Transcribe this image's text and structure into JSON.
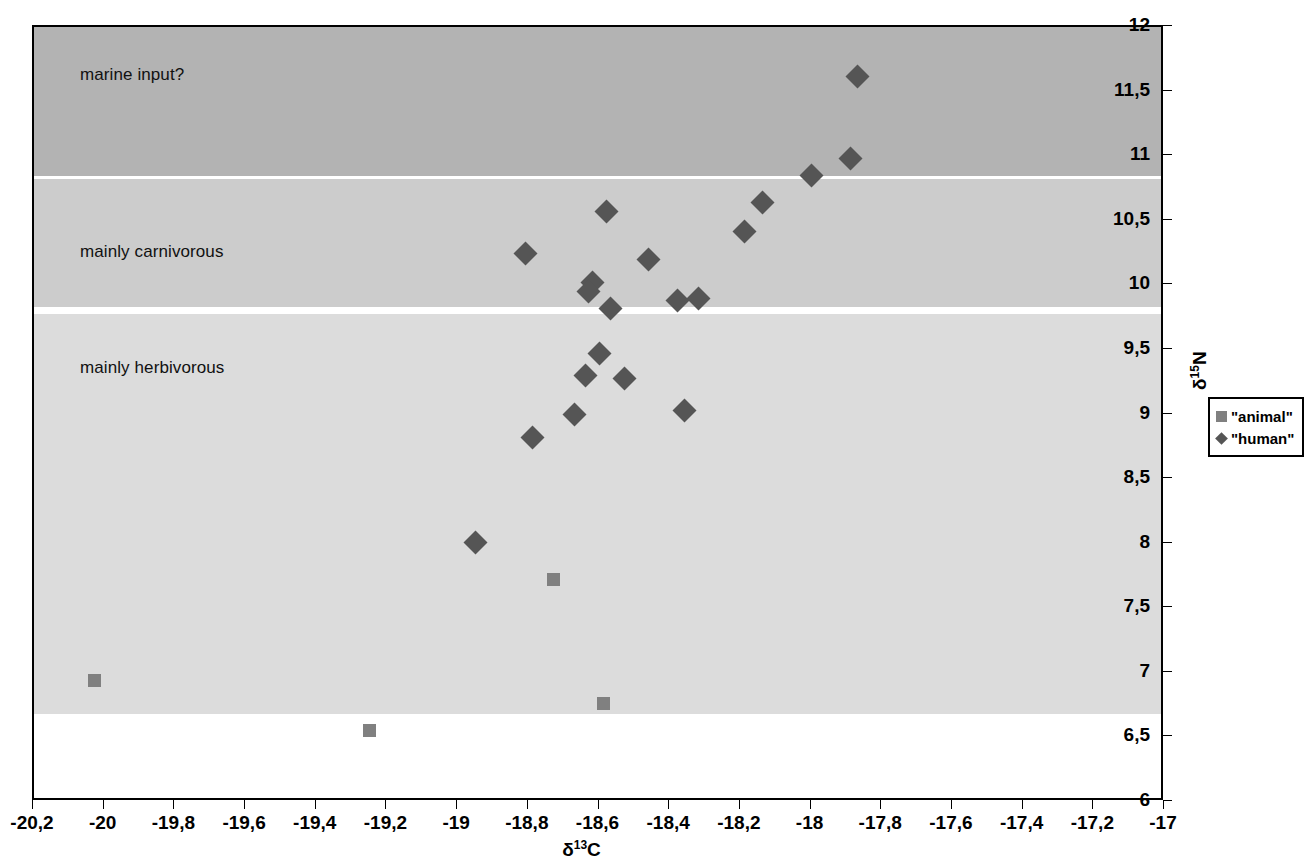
{
  "chart_data": {
    "type": "scatter",
    "title": "",
    "xlabel": "δ13C",
    "ylabel": "δ15N",
    "xlabel_base": "δ",
    "xlabel_sup": "13",
    "xlabel_tail": "C",
    "ylabel_base": "δ",
    "ylabel_sup": "15",
    "ylabel_tail": "N",
    "xlim": [
      -20.2,
      -17.0
    ],
    "ylim": [
      6,
      12
    ],
    "grid": false,
    "y_axis_position": "right",
    "xticks": [
      "-20,2",
      "-20",
      "-19,8",
      "-19,6",
      "-19,4",
      "-19,2",
      "-19",
      "-18,8",
      "-18,6",
      "-18,4",
      "-18,2",
      "-18",
      "-17,8",
      "-17,6",
      "-17,4",
      "-17,2",
      "-17"
    ],
    "xtick_values": [
      -20.2,
      -20.0,
      -19.8,
      -19.6,
      -19.4,
      -19.2,
      -19.0,
      -18.8,
      -18.6,
      -18.4,
      -18.2,
      -18.0,
      -17.8,
      -17.6,
      -17.4,
      -17.2,
      -17.0
    ],
    "yticks": [
      "12",
      "11,5",
      "11",
      "10,5",
      "10",
      "9,5",
      "9",
      "8,5",
      "8",
      "7,5",
      "7",
      "6,5",
      "6"
    ],
    "ytick_values": [
      12,
      11.5,
      11,
      10.5,
      10,
      9.5,
      9,
      8.5,
      8,
      7.5,
      7,
      6.5,
      6
    ],
    "legend_position": "outside-right",
    "legend": [
      {
        "label": "\"animal\"",
        "marker": "square",
        "color": "#808080"
      },
      {
        "label": "\"human\"",
        "marker": "diamond",
        "color": "#555555"
      }
    ],
    "bands": [
      {
        "label": "marine input?",
        "y_from": 10.85,
        "y_to": 12.0,
        "color": "#b3b3b3",
        "label_y": 11.62
      },
      {
        "label": "mainly carnivorous",
        "y_from": 9.83,
        "y_to": 10.82,
        "color": "#cccccc",
        "label_y": 10.25
      },
      {
        "label": "mainly herbivorous",
        "y_from": 6.68,
        "y_to": 9.78,
        "color": "#dcdcdc",
        "label_y": 9.35
      }
    ],
    "series": [
      {
        "name": "\"human\"",
        "marker": "diamond",
        "color": "#555555",
        "points": [
          {
            "x": -17.87,
            "y": 11.62
          },
          {
            "x": -17.89,
            "y": 10.98
          },
          {
            "x": -18.0,
            "y": 10.85
          },
          {
            "x": -18.14,
            "y": 10.64
          },
          {
            "x": -18.58,
            "y": 10.57
          },
          {
            "x": -18.19,
            "y": 10.42
          },
          {
            "x": -18.81,
            "y": 10.25
          },
          {
            "x": -18.46,
            "y": 10.2
          },
          {
            "x": -18.62,
            "y": 10.02
          },
          {
            "x": -18.63,
            "y": 9.95
          },
          {
            "x": -18.38,
            "y": 9.88
          },
          {
            "x": -18.32,
            "y": 9.9
          },
          {
            "x": -18.57,
            "y": 9.82
          },
          {
            "x": -18.6,
            "y": 9.47
          },
          {
            "x": -18.64,
            "y": 9.3
          },
          {
            "x": -18.53,
            "y": 9.28
          },
          {
            "x": -18.36,
            "y": 9.03
          },
          {
            "x": -18.67,
            "y": 9.0
          },
          {
            "x": -18.79,
            "y": 8.82
          },
          {
            "x": -18.95,
            "y": 8.01
          }
        ]
      },
      {
        "name": "\"animal\"",
        "marker": "square",
        "color": "#808080",
        "points": [
          {
            "x": -18.73,
            "y": 7.72
          },
          {
            "x": -20.03,
            "y": 6.94
          },
          {
            "x": -18.59,
            "y": 6.76
          },
          {
            "x": -19.25,
            "y": 6.55
          }
        ]
      }
    ]
  }
}
